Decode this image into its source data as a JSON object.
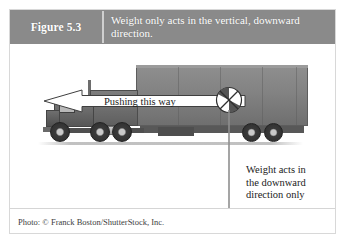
{
  "figure": {
    "label": "Figure 5.3",
    "caption": "Weight only acts in the vertical, downward direction.",
    "credit": "Photo: © Franck Boston/ShutterStock, Inc."
  },
  "illustration": {
    "push_arrow_label": "Pushing this way",
    "weight_label_line1": "Weight acts in",
    "weight_label_line2": "the downward",
    "weight_label_line3": "direction only",
    "cg_symbol_name": "center-of-gravity-symbol",
    "subject": "semi-truck-side-view"
  },
  "colors": {
    "header_band": "#8a8a8a",
    "header_text": "#ffffff",
    "divider": "#cfcfcf",
    "frame_border": "#d8d8d8",
    "panel_background": "#ffffff",
    "arrow_outline": "#3a3a3a",
    "arrow_fill": "#ffffff",
    "weight_arrow": "#8f8f8f",
    "body_text": "#1b1b1b",
    "credit_text": "#3d3d3d"
  }
}
